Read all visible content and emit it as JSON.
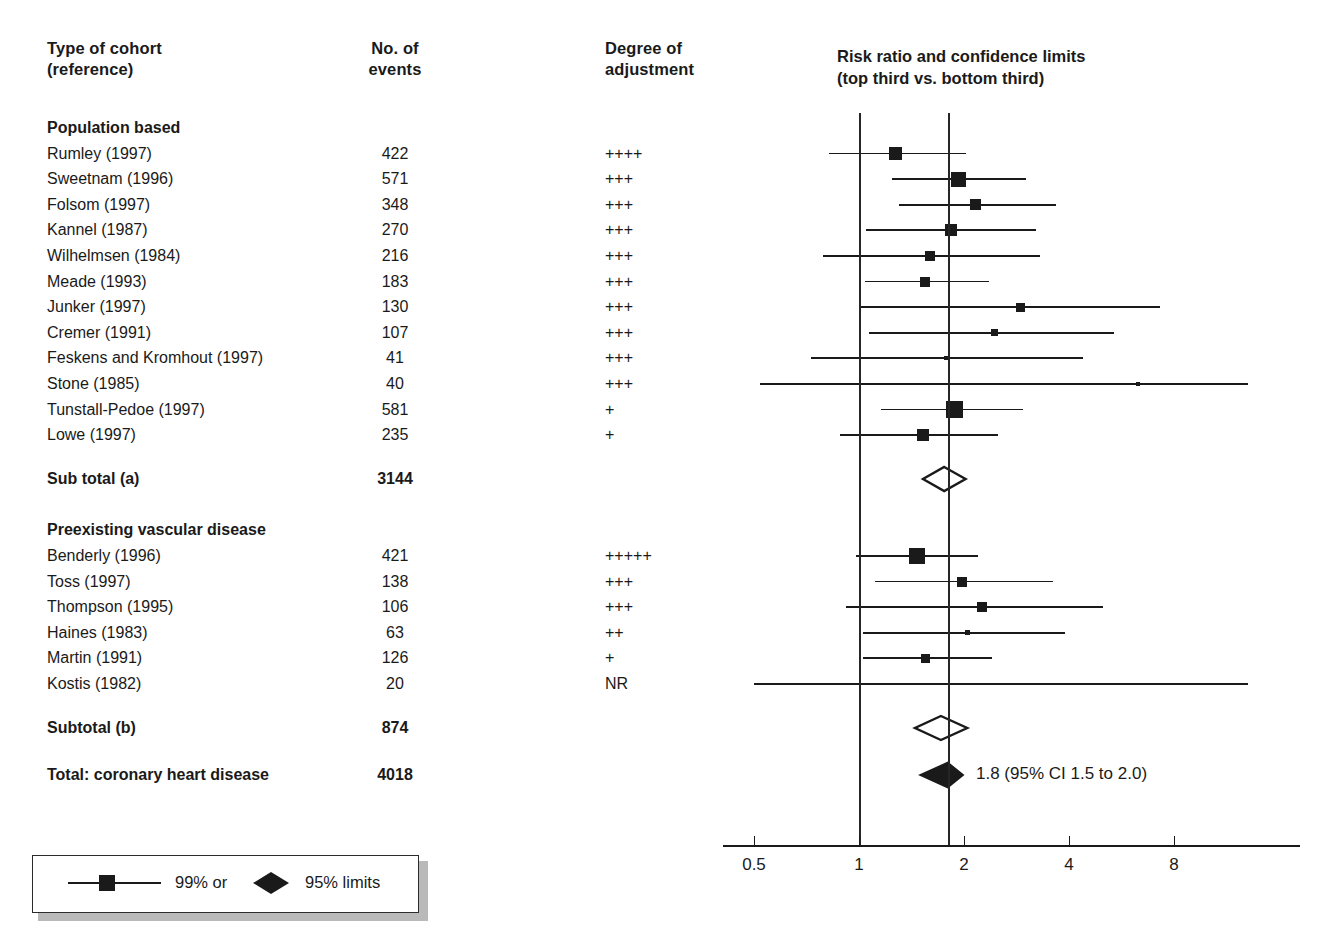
{
  "figure": {
    "columns": {
      "cohort_header_line1": "Type of cohort",
      "cohort_header_line2": "(reference)",
      "events_header_line1": "No. of",
      "events_header_line2": "events",
      "adjust_header_line1": "Degree of",
      "adjust_header_line2": "adjustment",
      "plot_header_line1": "Risk ratio and confidence limits",
      "plot_header_line2": "(top third vs. bottom third)"
    },
    "groups": [
      {
        "label": "Population based",
        "rows": [
          {
            "cohort": "Rumley (1997)",
            "events": "422",
            "adjustment": "++++",
            "rr": 1.27,
            "lo": 0.82,
            "hi": 2.02,
            "box": 13
          },
          {
            "cohort": "Sweetnam (1996)",
            "events": "571",
            "adjustment": "+++",
            "rr": 1.93,
            "lo": 1.24,
            "hi": 3.02,
            "box": 15
          },
          {
            "cohort": "Folsom (1997)",
            "events": "348",
            "adjustment": "+++",
            "rr": 2.16,
            "lo": 1.3,
            "hi": 3.66,
            "box": 11
          },
          {
            "cohort": "Kannel (1987)",
            "events": "270",
            "adjustment": "+++",
            "rr": 1.83,
            "lo": 1.05,
            "hi": 3.22,
            "box": 12
          },
          {
            "cohort": "Wilhelmsen (1984)",
            "events": "216",
            "adjustment": "+++",
            "rr": 1.6,
            "lo": 0.79,
            "hi": 3.3,
            "box": 10
          },
          {
            "cohort": "Meade (1993)",
            "events": "183",
            "adjustment": "+++",
            "rr": 1.55,
            "lo": 1.04,
            "hi": 2.36,
            "box": 10
          },
          {
            "cohort": "Junker (1997)",
            "events": "130",
            "adjustment": "+++",
            "rr": 2.9,
            "lo": 1.0,
            "hi": 7.3,
            "box": 9
          },
          {
            "cohort": "Cremer (1991)",
            "events": "107",
            "adjustment": "+++",
            "rr": 2.45,
            "lo": 1.07,
            "hi": 5.4,
            "box": 7
          },
          {
            "cohort": "Feskens and Kromhout (1997)",
            "events": "41",
            "adjustment": "+++",
            "rr": 1.78,
            "lo": 0.73,
            "hi": 4.4,
            "box": 4
          },
          {
            "cohort": "Stone (1985)",
            "events": "40",
            "adjustment": "+++",
            "rr": 6.3,
            "lo": 0.52,
            "hi": 13.0,
            "box": 4
          },
          {
            "cohort": "Tunstall-Pedoe (1997)",
            "events": "581",
            "adjustment": "+",
            "rr": 1.88,
            "lo": 1.16,
            "hi": 2.95,
            "box": 17
          },
          {
            "cohort": "Lowe (1997)",
            "events": "235",
            "adjustment": "+",
            "rr": 1.53,
            "lo": 0.88,
            "hi": 2.5,
            "box": 12
          }
        ],
        "subtotal_label": "Sub total (a)",
        "subtotal_events": "3144",
        "subtotal_rr": 1.76,
        "subtotal_lo": 1.52,
        "subtotal_hi": 2.04
      },
      {
        "label": "Preexisting vascular disease",
        "rows": [
          {
            "cohort": "Benderly (1996)",
            "events": "421",
            "adjustment": "+++++",
            "rr": 1.47,
            "lo": 0.98,
            "hi": 2.2,
            "box": 16
          },
          {
            "cohort": "Toss (1997)",
            "events": "138",
            "adjustment": "+++",
            "rr": 1.97,
            "lo": 1.11,
            "hi": 3.6,
            "box": 10
          },
          {
            "cohort": "Thompson (1995)",
            "events": "106",
            "adjustment": "+++",
            "rr": 2.25,
            "lo": 0.92,
            "hi": 5.0,
            "box": 10
          },
          {
            "cohort": "Haines (1983)",
            "events": "63",
            "adjustment": "++",
            "rr": 2.05,
            "lo": 1.03,
            "hi": 3.9,
            "box": 5
          },
          {
            "cohort": "Martin (1991)",
            "events": "126",
            "adjustment": "+",
            "rr": 1.55,
            "lo": 1.03,
            "hi": 2.4,
            "box": 9
          },
          {
            "cohort": "Kostis (1982)",
            "events": "20",
            "adjustment": "NR",
            "rr": null,
            "lo": 0.5,
            "hi": 13.0,
            "box": 0
          }
        ],
        "subtotal_label": "Subtotal (b)",
        "subtotal_events": "874",
        "subtotal_rr": 1.72,
        "subtotal_lo": 1.44,
        "subtotal_hi": 2.06
      }
    ],
    "total": {
      "label": "Total: coronary heart disease",
      "events": "4018",
      "rr": 1.8,
      "lo": 1.5,
      "hi": 2.0,
      "annotation": "1.8 (95% CI 1.5 to 2.0)"
    },
    "axis": {
      "scale": "log",
      "ticks": [
        "0.5",
        "1",
        "2",
        "4",
        "8"
      ],
      "tick_values": [
        0.5,
        1,
        2,
        4,
        8
      ],
      "reference_line": 1,
      "pooled_line": 1.8
    },
    "legend": {
      "item1": "99% or",
      "item2": "95% limits"
    },
    "colors": {
      "ink": "#1a1a1a",
      "rule": "#262626",
      "legend_shadow": "#b9b9b9"
    }
  },
  "chart_data": {
    "type": "forest",
    "title": "Risk ratio and confidence limits (top third vs. bottom third)",
    "xlabel": "Risk ratio",
    "xscale": "log",
    "xlim": [
      0.42,
      13.0
    ],
    "xticks": [
      0.5,
      1,
      2,
      4,
      8
    ],
    "reference_line": 1,
    "pooled_line": 1.8,
    "studies": [
      {
        "name": "Rumley (1997)",
        "group": "Population based",
        "events": 422,
        "adjustment": "++++",
        "rr": 1.27,
        "ci": [
          0.82,
          2.02
        ]
      },
      {
        "name": "Sweetnam (1996)",
        "group": "Population based",
        "events": 571,
        "adjustment": "+++",
        "rr": 1.93,
        "ci": [
          1.24,
          3.02
        ]
      },
      {
        "name": "Folsom (1997)",
        "group": "Population based",
        "events": 348,
        "adjustment": "+++",
        "rr": 2.16,
        "ci": [
          1.3,
          3.66
        ]
      },
      {
        "name": "Kannel (1987)",
        "group": "Population based",
        "events": 270,
        "adjustment": "+++",
        "rr": 1.83,
        "ci": [
          1.05,
          3.22
        ]
      },
      {
        "name": "Wilhelmsen (1984)",
        "group": "Population based",
        "events": 216,
        "adjustment": "+++",
        "rr": 1.6,
        "ci": [
          0.79,
          3.3
        ]
      },
      {
        "name": "Meade (1993)",
        "group": "Population based",
        "events": 183,
        "adjustment": "+++",
        "rr": 1.55,
        "ci": [
          1.04,
          2.36
        ]
      },
      {
        "name": "Junker (1997)",
        "group": "Population based",
        "events": 130,
        "adjustment": "+++",
        "rr": 2.9,
        "ci": [
          1.0,
          7.3
        ]
      },
      {
        "name": "Cremer (1991)",
        "group": "Population based",
        "events": 107,
        "adjustment": "+++",
        "rr": 2.45,
        "ci": [
          1.07,
          5.4
        ]
      },
      {
        "name": "Feskens and Kromhout (1997)",
        "group": "Population based",
        "events": 41,
        "adjustment": "+++",
        "rr": 1.78,
        "ci": [
          0.73,
          4.4
        ]
      },
      {
        "name": "Stone (1985)",
        "group": "Population based",
        "events": 40,
        "adjustment": "+++",
        "rr": 6.3,
        "ci": [
          0.52,
          13.0
        ]
      },
      {
        "name": "Tunstall-Pedoe (1997)",
        "group": "Population based",
        "events": 581,
        "adjustment": "+",
        "rr": 1.88,
        "ci": [
          1.16,
          2.95
        ]
      },
      {
        "name": "Lowe (1997)",
        "group": "Population based",
        "events": 235,
        "adjustment": "+",
        "rr": 1.53,
        "ci": [
          0.88,
          2.5
        ]
      },
      {
        "name": "Benderly (1996)",
        "group": "Preexisting vascular disease",
        "events": 421,
        "adjustment": "+++++",
        "rr": 1.47,
        "ci": [
          0.98,
          2.2
        ]
      },
      {
        "name": "Toss (1997)",
        "group": "Preexisting vascular disease",
        "events": 138,
        "adjustment": "+++",
        "rr": 1.97,
        "ci": [
          1.11,
          3.6
        ]
      },
      {
        "name": "Thompson (1995)",
        "group": "Preexisting vascular disease",
        "events": 106,
        "adjustment": "+++",
        "rr": 2.25,
        "ci": [
          0.92,
          5.0
        ]
      },
      {
        "name": "Haines (1983)",
        "group": "Preexisting vascular disease",
        "events": 63,
        "adjustment": "++",
        "rr": 2.05,
        "ci": [
          1.03,
          3.9
        ]
      },
      {
        "name": "Martin (1991)",
        "group": "Preexisting vascular disease",
        "events": 126,
        "adjustment": "+",
        "rr": 1.55,
        "ci": [
          1.03,
          2.4
        ]
      },
      {
        "name": "Kostis (1982)",
        "group": "Preexisting vascular disease",
        "events": 20,
        "adjustment": "NR",
        "rr": null,
        "ci": [
          0.5,
          13.0
        ]
      }
    ],
    "summaries": [
      {
        "name": "Sub total (a)",
        "events": 3144,
        "rr": 1.76,
        "ci": [
          1.52,
          2.04
        ],
        "filled": false
      },
      {
        "name": "Subtotal (b)",
        "events": 874,
        "rr": 1.72,
        "ci": [
          1.44,
          2.06
        ],
        "filled": false
      },
      {
        "name": "Total: coronary heart disease",
        "events": 4018,
        "rr": 1.8,
        "ci": [
          1.5,
          2.0
        ],
        "filled": true
      }
    ],
    "legend": [
      "99% or",
      "95% limits"
    ]
  }
}
